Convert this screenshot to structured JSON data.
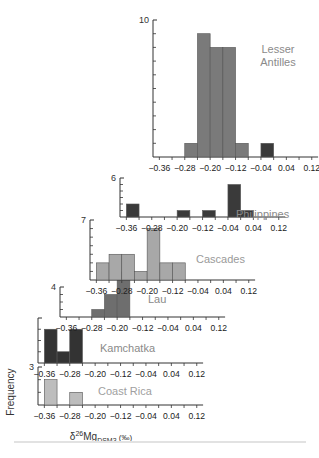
{
  "chart_data": {
    "type": "bar",
    "title": "",
    "xlabel": "δ26Mg_DSM3 (‰)",
    "xlabel_parts": {
      "delta": "δ",
      "sup": "26",
      "base": "Mg",
      "sub": "DSM3",
      "unit": "(‰)"
    },
    "ylabel": "Frequency",
    "xlim": [
      -0.38,
      0.14
    ],
    "xticks": [
      -0.36,
      -0.28,
      -0.2,
      -0.12,
      -0.04,
      0.04,
      0.12
    ],
    "xtick_labels": [
      "−0.36",
      "−0.28",
      "−0.20",
      "−0.12",
      "−0.04",
      "0.04",
      "0.12"
    ],
    "bin_width": 0.04,
    "layout": "stacked offset histograms (waterfall)",
    "panels": [
      {
        "name": "Lesser Antilles",
        "ymax_label": "10",
        "ymax": 10,
        "color": "#7a7a7a",
        "label_color": "#8a8a8a",
        "bins": [
          {
            "x0": -0.28,
            "count": 1
          },
          {
            "x0": -0.24,
            "count": 9
          },
          {
            "x0": -0.2,
            "count": 8
          },
          {
            "x0": -0.16,
            "count": 8
          },
          {
            "x0": -0.12,
            "count": 1
          },
          {
            "x0": -0.04,
            "count": 1,
            "color": "#3a3a3a"
          }
        ]
      },
      {
        "name": "Philippines",
        "ymax_label": "6",
        "ymax": 6,
        "color": "#3a3a3a",
        "label_color": "#8a8a8a",
        "bins": [
          {
            "x0": -0.36,
            "count": 2
          },
          {
            "x0": -0.2,
            "count": 1
          },
          {
            "x0": -0.12,
            "count": 1
          },
          {
            "x0": -0.04,
            "count": 5
          },
          {
            "x0": 0.0,
            "count": 1
          }
        ]
      },
      {
        "name": "Cascades",
        "ymax_label": "7",
        "ymax": 7,
        "color": "#a8a8a8",
        "label_color": "#9a9a9a",
        "bins": [
          {
            "x0": -0.36,
            "count": 2
          },
          {
            "x0": -0.32,
            "count": 3
          },
          {
            "x0": -0.28,
            "count": 3
          },
          {
            "x0": -0.24,
            "count": 1
          },
          {
            "x0": -0.2,
            "count": 6
          },
          {
            "x0": -0.16,
            "count": 2
          },
          {
            "x0": -0.12,
            "count": 2
          }
        ]
      },
      {
        "name": "Lau",
        "ymax_label": "4",
        "ymax": 4,
        "color": "#6e6e6e",
        "label_color": "#8a8a8a",
        "bins": [
          {
            "x0": -0.28,
            "count": 1
          },
          {
            "x0": -0.24,
            "count": 3
          },
          {
            "x0": -0.2,
            "count": 6
          }
        ]
      },
      {
        "name": "Kamchatka",
        "ymax_label": "",
        "ymax": 4,
        "color": "#333333",
        "label_color": "#8a8a8a",
        "bins": [
          {
            "x0": -0.36,
            "count": 3
          },
          {
            "x0": -0.32,
            "count": 1
          },
          {
            "x0": -0.28,
            "count": 3
          }
        ]
      },
      {
        "name": "Coast Rica",
        "ymax_label": "3",
        "ymax": 3,
        "color": "#bdbdbd",
        "label_color": "#a0a0a0",
        "bins": [
          {
            "x0": -0.36,
            "count": 2
          },
          {
            "x0": -0.28,
            "count": 1
          }
        ]
      }
    ]
  }
}
